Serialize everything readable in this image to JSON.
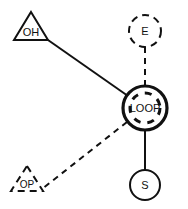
{
  "diagram": {
    "background_color": "#ffffff",
    "stroke_color": "#111111",
    "nodes": [
      {
        "id": "oh",
        "label": "OH",
        "shape": "triangle",
        "line_style": "solid",
        "position": {
          "cx": 31,
          "cy": 27
        },
        "size": {
          "width": 36,
          "height": 29
        }
      },
      {
        "id": "e",
        "label": "E",
        "shape": "circle",
        "line_style": "dashed",
        "position": {
          "cx": 145,
          "cy": 31
        },
        "size": {
          "radius": 16
        }
      },
      {
        "id": "loop",
        "label": "LOOP",
        "shape": "double-circle",
        "line_style": "solid-outer-dashed-inner",
        "position": {
          "cx": 145,
          "cy": 108
        },
        "size": {
          "radius_outer": 22,
          "radius_inner": 15
        }
      },
      {
        "id": "s",
        "label": "S",
        "shape": "circle",
        "line_style": "solid",
        "position": {
          "cx": 145,
          "cy": 185
        },
        "size": {
          "radius": 15
        }
      },
      {
        "id": "op",
        "label": "OP",
        "shape": "triangle",
        "line_style": "dashed",
        "position": {
          "cx": 27,
          "cy": 180
        },
        "size": {
          "width": 32,
          "height": 26
        }
      }
    ],
    "edges": [
      {
        "id": "oh-loop",
        "from": "OH",
        "to": "LOOP",
        "line_style": "solid"
      },
      {
        "id": "e-loop",
        "from": "E",
        "to": "LOOP",
        "line_style": "dashed"
      },
      {
        "id": "loop-s",
        "from": "LOOP",
        "to": "S",
        "line_style": "solid"
      },
      {
        "id": "loop-op",
        "from": "LOOP",
        "to": "OP",
        "line_style": "dashed"
      }
    ]
  }
}
